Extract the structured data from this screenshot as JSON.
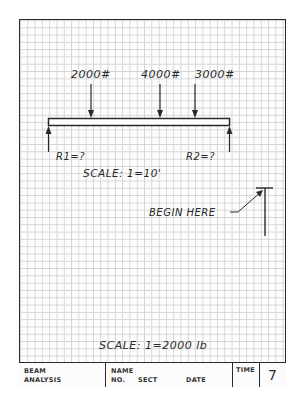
{
  "diagram": {
    "type": "beam-free-body-diagram",
    "loads": [
      {
        "label": "2000#",
        "value_lb": 2000
      },
      {
        "label": "4000#",
        "value_lb": 4000
      },
      {
        "label": "3000#",
        "value_lb": 3000
      }
    ],
    "reactions": [
      {
        "label": "R1=?"
      },
      {
        "label": "R2=?"
      }
    ],
    "length_scale": "SCALE:  1=10'",
    "force_scale": "SCALE:  1=2000  lb",
    "begin_label": "BEGIN  HERE"
  },
  "title_block": {
    "title_line1": "BEAM",
    "title_line2": "ANALYSIS",
    "name_label": "NAME",
    "no_label": "NO.",
    "sect_label": "SECT",
    "date_label": "DATE",
    "time_label": "TIME",
    "sheet_number": "7"
  },
  "colors": {
    "ink": "#2a2a2a",
    "grid": "#d4d4d4",
    "paper": "#fdfdfd"
  }
}
